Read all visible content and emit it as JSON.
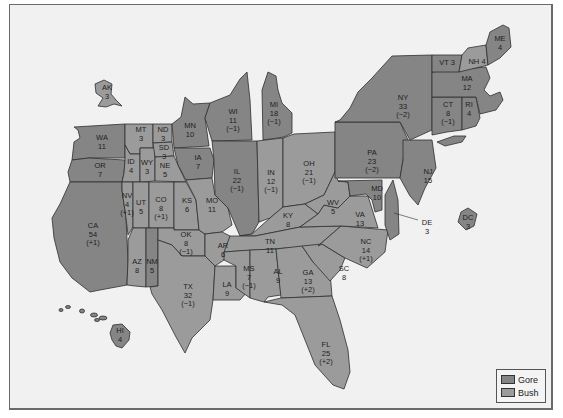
{
  "colors": {
    "gore": "#858585",
    "bush": "#9b9b9b",
    "background": "#f1f1f1",
    "border": "#2e2e2e"
  },
  "legend": {
    "items": [
      {
        "label": "Gore",
        "color": "#858585"
      },
      {
        "label": "Bush",
        "color": "#9b9b9b"
      }
    ]
  },
  "states": {
    "AK": {
      "abbr": "AK",
      "votes": "3",
      "change": "",
      "winner": "Bush"
    },
    "HI": {
      "abbr": "HI",
      "votes": "4",
      "change": "",
      "winner": "Gore"
    },
    "WA": {
      "abbr": "WA",
      "votes": "11",
      "change": "",
      "winner": "Gore"
    },
    "OR": {
      "abbr": "OR",
      "votes": "7",
      "change": "",
      "winner": "Gore"
    },
    "CA": {
      "abbr": "CA",
      "votes": "54",
      "change": "(+1)",
      "winner": "Gore"
    },
    "MT": {
      "abbr": "MT",
      "votes": "3",
      "change": "",
      "winner": "Bush"
    },
    "ID": {
      "abbr": "ID",
      "votes": "4",
      "change": "",
      "winner": "Bush"
    },
    "WY": {
      "abbr": "WY",
      "votes": "3",
      "change": "",
      "winner": "Bush"
    },
    "NV": {
      "abbr": "NV",
      "votes": "4",
      "change": "(+1)",
      "winner": "Bush"
    },
    "UT": {
      "abbr": "UT",
      "votes": "5",
      "change": "",
      "winner": "Bush"
    },
    "CO": {
      "abbr": "CO",
      "votes": "8",
      "change": "(+1)",
      "winner": "Bush"
    },
    "AZ": {
      "abbr": "AZ",
      "votes": "8",
      "change": "",
      "winner": "Bush"
    },
    "NM": {
      "abbr": "NM",
      "votes": "5",
      "change": "",
      "winner": "Gore"
    },
    "ND": {
      "abbr": "ND",
      "votes": "3",
      "change": "",
      "winner": "Bush"
    },
    "SD": {
      "abbr": "SD",
      "votes": "3",
      "change": "",
      "winner": "Bush"
    },
    "NE": {
      "abbr": "NE",
      "votes": "5",
      "change": "",
      "winner": "Bush"
    },
    "KS": {
      "abbr": "KS",
      "votes": "6",
      "change": "",
      "winner": "Bush"
    },
    "OK": {
      "abbr": "OK",
      "votes": "8",
      "change": "(−1)",
      "winner": "Bush"
    },
    "TX": {
      "abbr": "TX",
      "votes": "32",
      "change": "(−1)",
      "winner": "Bush"
    },
    "MN": {
      "abbr": "MN",
      "votes": "10",
      "change": "",
      "winner": "Gore"
    },
    "IA": {
      "abbr": "IA",
      "votes": "7",
      "change": "",
      "winner": "Gore"
    },
    "MO": {
      "abbr": "MO",
      "votes": "11",
      "change": "",
      "winner": "Bush"
    },
    "AR": {
      "abbr": "AR",
      "votes": "6",
      "change": "",
      "winner": "Bush"
    },
    "LA": {
      "abbr": "LA",
      "votes": "9",
      "change": "",
      "winner": "Bush"
    },
    "WI": {
      "abbr": "WI",
      "votes": "11",
      "change": "(−1)",
      "winner": "Gore"
    },
    "IL": {
      "abbr": "IL",
      "votes": "22",
      "change": "(−1)",
      "winner": "Gore"
    },
    "MI": {
      "abbr": "MI",
      "votes": "18",
      "change": "(−1)",
      "winner": "Gore"
    },
    "IN": {
      "abbr": "IN",
      "votes": "12",
      "change": "(−1)",
      "winner": "Bush"
    },
    "OH": {
      "abbr": "OH",
      "votes": "21",
      "change": "(−1)",
      "winner": "Bush"
    },
    "KY": {
      "abbr": "KY",
      "votes": "8",
      "change": "",
      "winner": "Bush"
    },
    "TN": {
      "abbr": "TN",
      "votes": "11",
      "change": "",
      "winner": "Bush"
    },
    "MS": {
      "abbr": "MS",
      "votes": "7",
      "change": "(−1)",
      "winner": "Bush"
    },
    "AL": {
      "abbr": "AL",
      "votes": "9",
      "change": "",
      "winner": "Bush"
    },
    "GA": {
      "abbr": "GA",
      "votes": "13",
      "change": "(+2)",
      "winner": "Bush"
    },
    "FL": {
      "abbr": "FL",
      "votes": "25",
      "change": "(+2)",
      "winner": "Bush"
    },
    "SC": {
      "abbr": "SC",
      "votes": "8",
      "change": "",
      "winner": "Bush"
    },
    "NC": {
      "abbr": "NC",
      "votes": "14",
      "change": "(+1)",
      "winner": "Bush"
    },
    "VA": {
      "abbr": "VA",
      "votes": "13",
      "change": "",
      "winner": "Bush"
    },
    "WV": {
      "abbr": "WV",
      "votes": "5",
      "change": "",
      "winner": "Bush"
    },
    "MD": {
      "abbr": "MD",
      "votes": "10",
      "change": "",
      "winner": "Gore"
    },
    "DE": {
      "abbr": "DE",
      "votes": "3",
      "change": "",
      "winner": "Gore"
    },
    "DC": {
      "abbr": "DC",
      "votes": "3",
      "change": "",
      "winner": "Gore"
    },
    "PA": {
      "abbr": "PA",
      "votes": "23",
      "change": "(−2)",
      "winner": "Gore"
    },
    "NJ": {
      "abbr": "NJ",
      "votes": "15",
      "change": "",
      "winner": "Gore"
    },
    "NY": {
      "abbr": "NY",
      "votes": "33",
      "change": "(−2)",
      "winner": "Gore"
    },
    "CT": {
      "abbr": "CT",
      "votes": "8",
      "change": "(−1)",
      "winner": "Gore"
    },
    "RI": {
      "abbr": "RI",
      "votes": "4",
      "change": "",
      "winner": "Gore"
    },
    "MA": {
      "abbr": "MA",
      "votes": "12",
      "change": "",
      "winner": "Gore"
    },
    "VT": {
      "abbr": "VT",
      "votes": "3",
      "change": "",
      "winner": "Gore"
    },
    "NH": {
      "abbr": "NH",
      "votes": "4",
      "change": "",
      "winner": "Bush"
    },
    "ME": {
      "abbr": "ME",
      "votes": "4",
      "change": "",
      "winner": "Gore"
    }
  }
}
